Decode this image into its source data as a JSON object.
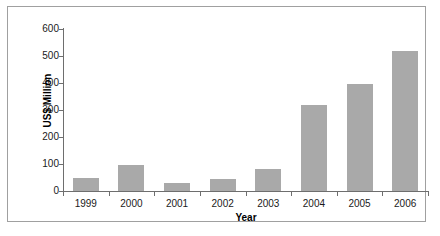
{
  "chart_data": {
    "type": "bar",
    "title": "",
    "xlabel": "Year",
    "ylabel": "US$ Million",
    "categories": [
      "1999",
      "2000",
      "2001",
      "2002",
      "2003",
      "2004",
      "2005",
      "2006"
    ],
    "values": [
      50,
      95,
      30,
      45,
      80,
      318,
      398,
      520
    ],
    "series": [
      {
        "name": "US$ Million",
        "values": [
          50,
          95,
          30,
          45,
          80,
          318,
          398,
          520
        ]
      }
    ],
    "ylim": [
      0,
      600
    ],
    "ytick_labels": [
      "600",
      "500",
      "400",
      "300",
      "200",
      "100",
      "0"
    ],
    "ytick_values": [
      600,
      500,
      400,
      300,
      200,
      100,
      0
    ],
    "grid": false,
    "legend": "none",
    "bar_color": "#a9a9a9",
    "axis_color": "#6e6e6e",
    "frame_color": "#a0a0a0",
    "text_color": "#1a1a1a"
  }
}
